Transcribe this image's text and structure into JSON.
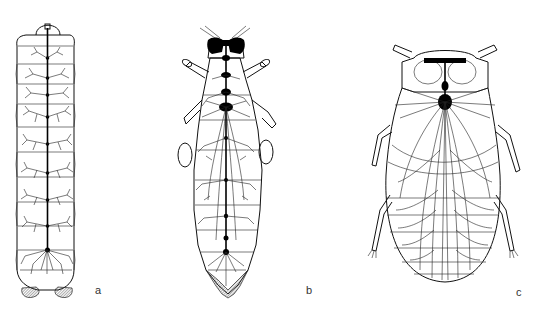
{
  "figure": {
    "panels": [
      {
        "id": "a",
        "label": "a",
        "subject": "larva with chain of separate segmental ganglia"
      },
      {
        "id": "b",
        "label": "b",
        "subject": "elongate insect with partially fused abdominal ganglia"
      },
      {
        "id": "c",
        "label": "c",
        "subject": "broad-bodied insect with ganglia fused into single thoracic mass"
      }
    ],
    "colors": {
      "line": "#111111",
      "background": "#ffffff",
      "label": "#333333"
    }
  }
}
